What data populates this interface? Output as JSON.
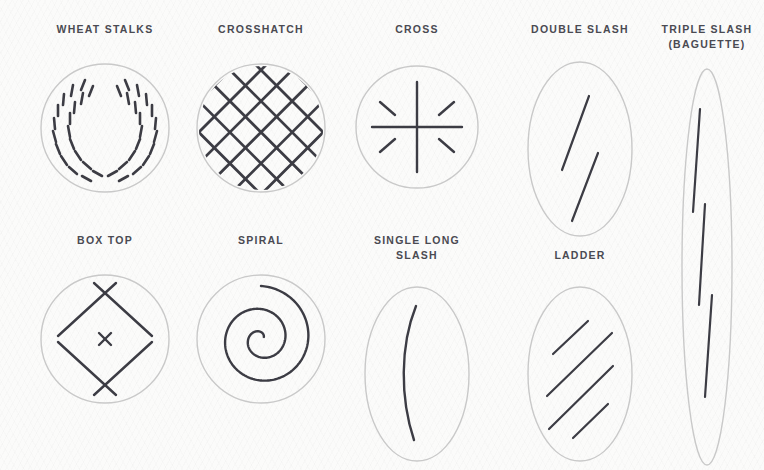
{
  "page": {
    "background_color": "#fbfbfa",
    "label_color": "#4a4a52",
    "outline_color": "#c9c9c9",
    "score_color": "#3c3c44"
  },
  "chart_data": {
    "type": "diagram",
    "title": "",
    "subtitle": "",
    "layout": "two-row grid of bread scoring patterns",
    "legend": "none",
    "items": [
      {
        "id": "wheat-stalks",
        "label": "WHEAT STALKS",
        "shape": "circle",
        "row": 1,
        "column": 1,
        "mark_count": 40,
        "description": "two mirrored arcs of short dashes forming a wreath"
      },
      {
        "id": "crosshatch",
        "label": "CROSSHATCH",
        "shape": "circle",
        "row": 1,
        "column": 2,
        "mark_count": 18,
        "description": "diagonal lattice of crossing lines clipped to circle"
      },
      {
        "id": "cross",
        "label": "CROSS",
        "shape": "circle",
        "row": 1,
        "column": 3,
        "mark_count": 6,
        "description": "vertical and horizontal line plus four short diagonal dashes"
      },
      {
        "id": "double-slash",
        "label": "DOUBLE SLASH",
        "shape": "oval",
        "row": 1,
        "column": 4,
        "mark_count": 2,
        "description": "two offset parallel slashes"
      },
      {
        "id": "triple-slash-baguette",
        "label": "TRIPLE SLASH\n(BAGUETTE)",
        "shape": "baguette",
        "row": 1,
        "column": 5,
        "mark_count": 3,
        "description": "three staggered near-vertical slashes in a narrow tall ellipse"
      },
      {
        "id": "box-top",
        "label": "BOX TOP",
        "shape": "circle",
        "row": 2,
        "column": 1,
        "mark_count": 5,
        "description": "rotated square with crossing corners and a small centre x"
      },
      {
        "id": "spiral",
        "label": "SPIRAL",
        "shape": "circle",
        "row": 2,
        "column": 2,
        "mark_count": 1,
        "description": "archimedean spiral of about two turns"
      },
      {
        "id": "single-long-slash",
        "label": "SINGLE LONG\nSLASH",
        "shape": "oval",
        "row": 2,
        "column": 3,
        "mark_count": 1,
        "description": "one long curved arc bowing to the left"
      },
      {
        "id": "ladder",
        "label": "LADDER",
        "shape": "oval",
        "row": 2,
        "column": 4,
        "mark_count": 4,
        "description": "four staggered parallel diagonal slashes"
      }
    ]
  }
}
